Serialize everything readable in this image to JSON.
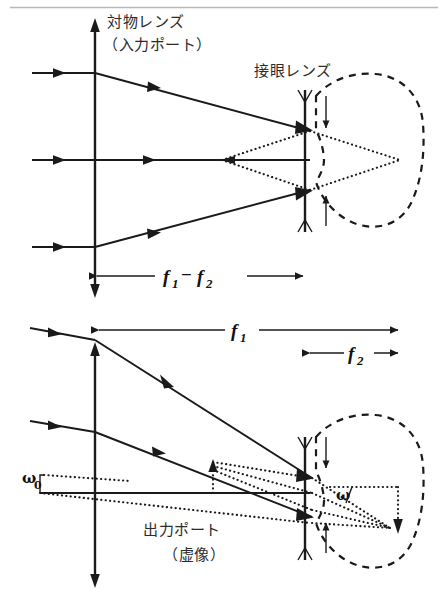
{
  "figure": {
    "background_color": "#ffffff",
    "ink_color": "#1a1a1a",
    "rule_color": "#b9b9b9",
    "width": 448,
    "height": 601
  },
  "labels": {
    "objective_lens": "対物レンズ",
    "objective_lens_port": "（入力ポート）",
    "eyepiece_lens": "接眼レンズ",
    "output_port": "出力ポート",
    "output_port_note": "（虚像）",
    "focal_diff_f": "f",
    "focal_diff_sub1": "1",
    "focal_minus": "−",
    "focal_diff_f2": "f",
    "focal_diff_sub2": "2",
    "f1_label": "f",
    "f1_sub": "1",
    "f2_label": "f",
    "f2_sub": "2",
    "omega0": "ω",
    "omega0_sub": "0",
    "omega": "ω"
  },
  "upper_diagram": {
    "caption": "Afocal telescope: three parallel input rays, objective at left, eyepiece at right, virtual image to the eye",
    "objective_x": 95,
    "eyepiece_x": 305,
    "axis_y": 160,
    "ray_entry_ys": [
      73,
      160,
      247
    ],
    "dimension_label": "f1 - f2",
    "dimension_from_x": 95,
    "dimension_to_x": 305
  },
  "lower_diagram": {
    "caption": "Tilted input beam at angle omega-zero exits the eyepiece at angle omega; virtual output port shown dotted",
    "objective_x": 95,
    "eyepiece_x": 305,
    "axis_y": 493,
    "input_angle_label": "ω0",
    "output_angle_label": "ω",
    "f1_from_x": 95,
    "f1_to_x": 400,
    "f2_from_x": 305,
    "f2_to_x": 400,
    "output_port_x": 213
  },
  "icons": {
    "input_rays": "arrow-right-icon",
    "objective": "double-arrow-vertical-icon",
    "eyepiece": "concave-lens-icon",
    "eye": "dashed-eye-outline-icon",
    "dimension": "double-headed-arrow-icon"
  }
}
